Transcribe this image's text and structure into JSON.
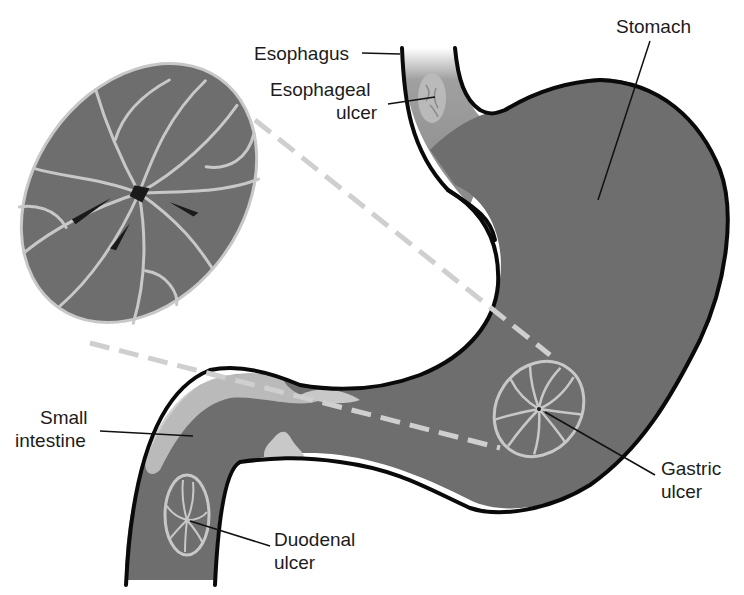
{
  "diagram": {
    "colors": {
      "tissue": "#6e6e6e",
      "tissue_light": "#8a8a8a",
      "mucosa_fold": "#c8c8c8",
      "outline": "#0a0a0a",
      "zoom_line": "#cfcfcf",
      "label": "#1c1c1c"
    },
    "labels": {
      "esophagus": "Esophagus",
      "esophageal_ulcer_1": "Esophageal",
      "esophageal_ulcer_2": "ulcer",
      "stomach": "Stomach",
      "small_intestine_1": "Small",
      "small_intestine_2": "intestine",
      "gastric_ulcer_1": "Gastric",
      "gastric_ulcer_2": "ulcer",
      "duodenal_ulcer_1": "Duodenal",
      "duodenal_ulcer_2": "ulcer"
    },
    "callouts": {
      "magnified_view": "enlarged gastric ulcer"
    }
  }
}
